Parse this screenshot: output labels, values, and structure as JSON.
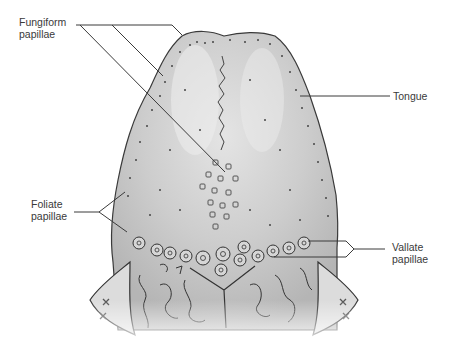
{
  "diagram": {
    "colors": {
      "tongue_fill": "#c9c9c9",
      "tongue_highlight": "#e6e6e6",
      "outline": "#3a3a3a",
      "leader_line": "#3a3a3a",
      "label_text": "#3a3a3a"
    },
    "labels": {
      "fungiform": {
        "line1": "Fungiform",
        "line2": "papillae"
      },
      "tongue": {
        "line1": "Tongue"
      },
      "foliate": {
        "line1": "Foliate",
        "line2": "papillae"
      },
      "vallate": {
        "line1": "Vallate",
        "line2": "papillae"
      }
    }
  }
}
